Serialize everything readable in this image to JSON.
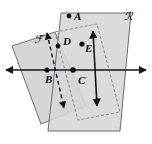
{
  "figure": {
    "background_color": "#ffffff",
    "plane_fill_color": "#d6d6d6",
    "plane_overlap_color": "#bcbcbc",
    "plane_edge_color": "#6f6f6f",
    "line_color": "#151515",
    "dash_color": "#151515",
    "point_color": "#111111",
    "label_color": "#111111"
  },
  "planes": [
    {
      "id": "plane-f",
      "label": "ℱ",
      "label_x": 34,
      "label_y": 43,
      "description": "left plane slanting down-left",
      "points": "55,32 12,46 41,124 86,106",
      "fill": "#d6d6d6",
      "stroke": "#6f6f6f"
    },
    {
      "id": "plane-r",
      "label": "ℛ",
      "label_x": 124,
      "label_y": 20,
      "description": "right plane slanting down-right",
      "points": "61,13 131,13 120,131 48,131",
      "fill": "#d6d6d6",
      "stroke": "#6f6f6f"
    }
  ],
  "hidden_outline": {
    "id": "hidden-parallelogram",
    "description": "dashed hidden edges of plane F behind plane R",
    "points": "55,32 97,24 120,112 78,120",
    "stroke": "#8a8a8a",
    "dash": "3,2"
  },
  "intersection_line": {
    "id": "line-bc",
    "label": "horizontal intersection line",
    "x1": 6,
    "y1": 70,
    "x2": 146,
    "y2": 70,
    "color": "#151515",
    "arrow_start": true,
    "arrow_end": true
  },
  "rays": [
    {
      "id": "ray-dashed",
      "label": "dashed line through D",
      "style": "dashed",
      "x1": 47,
      "y1": 33,
      "x2": 64,
      "y2": 108,
      "color": "#151515",
      "arrow_start": true,
      "arrow_end": true
    },
    {
      "id": "ray-solid",
      "label": "solid line through E",
      "style": "solid",
      "x1": 93,
      "y1": 31,
      "x2": 97,
      "y2": 106,
      "color": "#151515",
      "arrow_start": true,
      "arrow_end": true
    }
  ],
  "points": [
    {
      "id": "point-a",
      "label": "A",
      "cx": 69,
      "cy": 16,
      "label_x": 74,
      "label_y": 20
    },
    {
      "id": "point-b",
      "label": "B",
      "cx": 47,
      "cy": 70,
      "label_x": 45,
      "label_y": 83
    },
    {
      "id": "point-c",
      "label": "C",
      "cx": 73,
      "cy": 70,
      "label_x": 78,
      "label_y": 84
    },
    {
      "id": "point-d",
      "label": "D",
      "cx": 58,
      "cy": 46,
      "label_x": 63,
      "label_y": 45
    },
    {
      "id": "point-e",
      "label": "E",
      "cx": 82,
      "cy": 44,
      "label_x": 85,
      "label_y": 52
    }
  ]
}
